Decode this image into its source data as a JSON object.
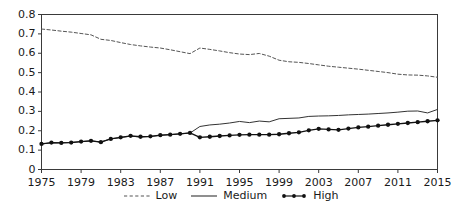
{
  "chart_data": {
    "type": "line",
    "title": "",
    "subtitle": "",
    "xlabel": "",
    "ylabel": "",
    "xlim": [
      1975,
      2015
    ],
    "ylim": [
      0,
      0.8
    ],
    "grid": false,
    "legend_position": "bottom-center",
    "x_ticks": [
      "1975",
      "1979",
      "1983",
      "1987",
      "1991",
      "1995",
      "1999",
      "2003",
      "2007",
      "2011",
      "2015"
    ],
    "x_tick_values": [
      1975,
      1979,
      1983,
      1987,
      1991,
      1995,
      1999,
      2003,
      2007,
      2011,
      2015
    ],
    "y_ticks": [
      "0",
      "0.1",
      "0.2",
      "0.3",
      "0.4",
      "0.5",
      "0.6",
      "0.7",
      "0.8"
    ],
    "y_tick_values": [
      0,
      0.1,
      0.2,
      0.3,
      0.4,
      0.5,
      0.6,
      0.7,
      0.8
    ],
    "x": [
      1975,
      1976,
      1977,
      1978,
      1979,
      1980,
      1981,
      1982,
      1983,
      1984,
      1985,
      1986,
      1987,
      1988,
      1989,
      1990,
      1991,
      1992,
      1993,
      1994,
      1995,
      1996,
      1997,
      1998,
      1999,
      2000,
      2001,
      2002,
      2003,
      2004,
      2005,
      2006,
      2007,
      2008,
      2009,
      2010,
      2011,
      2012,
      2013,
      2014,
      2015
    ],
    "series": [
      {
        "name": "Low",
        "style": "dashed",
        "color": "#555555",
        "marker": "none",
        "values": [
          0.725,
          0.72,
          0.714,
          0.709,
          0.702,
          0.695,
          0.672,
          0.666,
          0.655,
          0.645,
          0.638,
          0.632,
          0.627,
          0.618,
          0.608,
          0.598,
          0.627,
          0.62,
          0.612,
          0.603,
          0.596,
          0.593,
          0.599,
          0.585,
          0.564,
          0.556,
          0.553,
          0.547,
          0.54,
          0.533,
          0.528,
          0.523,
          0.518,
          0.512,
          0.506,
          0.5,
          0.492,
          0.488,
          0.487,
          0.483,
          0.476
        ]
      },
      {
        "name": "Medium",
        "style": "solid",
        "color": "#333333",
        "marker": "none",
        "values": [
          0.132,
          0.137,
          0.138,
          0.14,
          0.144,
          0.148,
          0.142,
          0.158,
          0.165,
          0.172,
          0.168,
          0.17,
          0.176,
          0.18,
          0.184,
          0.188,
          0.222,
          0.23,
          0.234,
          0.24,
          0.248,
          0.242,
          0.25,
          0.246,
          0.262,
          0.264,
          0.266,
          0.274,
          0.276,
          0.277,
          0.279,
          0.282,
          0.284,
          0.286,
          0.289,
          0.292,
          0.296,
          0.301,
          0.302,
          0.292,
          0.31
        ]
      },
      {
        "name": "High",
        "style": "dotted-marker",
        "color": "#111111",
        "marker": "circle",
        "values": [
          0.132,
          0.139,
          0.137,
          0.139,
          0.144,
          0.148,
          0.141,
          0.158,
          0.166,
          0.174,
          0.169,
          0.171,
          0.177,
          0.18,
          0.184,
          0.189,
          0.166,
          0.169,
          0.173,
          0.176,
          0.179,
          0.18,
          0.18,
          0.18,
          0.182,
          0.187,
          0.192,
          0.202,
          0.21,
          0.207,
          0.205,
          0.211,
          0.217,
          0.221,
          0.226,
          0.231,
          0.236,
          0.24,
          0.244,
          0.249,
          0.254
        ]
      }
    ]
  },
  "legend": {
    "items": [
      {
        "label": "Low"
      },
      {
        "label": "Medium"
      },
      {
        "label": "High"
      }
    ]
  }
}
